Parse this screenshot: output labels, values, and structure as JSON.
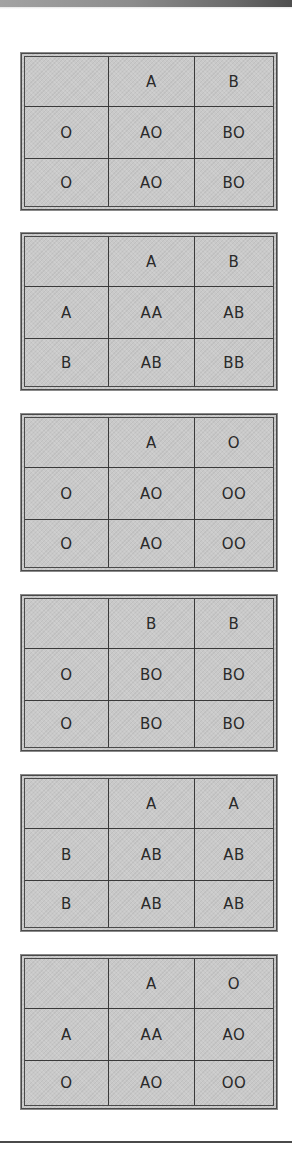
{
  "colors": {
    "cell_fill": "#c9c9c9",
    "border": "#4a4a4a",
    "text": "#2a2a2a",
    "top_band_left": "#a3a3a3",
    "top_band_right": "#4e4e4e"
  },
  "punnett_squares": [
    {
      "column_alleles": [
        "A",
        "B"
      ],
      "rows": [
        {
          "allele": "O",
          "cells": [
            "AO",
            "BO"
          ]
        },
        {
          "allele": "O",
          "cells": [
            "AO",
            "BO"
          ]
        }
      ]
    },
    {
      "column_alleles": [
        "A",
        "B"
      ],
      "rows": [
        {
          "allele": "A",
          "cells": [
            "AA",
            "AB"
          ]
        },
        {
          "allele": "B",
          "cells": [
            "AB",
            "BB"
          ]
        }
      ]
    },
    {
      "column_alleles": [
        "A",
        "O"
      ],
      "rows": [
        {
          "allele": "O",
          "cells": [
            "AO",
            "OO"
          ]
        },
        {
          "allele": "O",
          "cells": [
            "AO",
            "OO"
          ]
        }
      ]
    },
    {
      "column_alleles": [
        "B",
        "B"
      ],
      "rows": [
        {
          "allele": "O",
          "cells": [
            "BO",
            "BO"
          ]
        },
        {
          "allele": "O",
          "cells": [
            "BO",
            "BO"
          ]
        }
      ]
    },
    {
      "column_alleles": [
        "A",
        "A"
      ],
      "rows": [
        {
          "allele": "B",
          "cells": [
            "AB",
            "AB"
          ]
        },
        {
          "allele": "B",
          "cells": [
            "AB",
            "AB"
          ]
        }
      ]
    },
    {
      "column_alleles": [
        "A",
        "O"
      ],
      "rows": [
        {
          "allele": "A",
          "cells": [
            "AA",
            "AO"
          ]
        },
        {
          "allele": "O",
          "cells": [
            "AO",
            "OO"
          ]
        }
      ]
    }
  ]
}
